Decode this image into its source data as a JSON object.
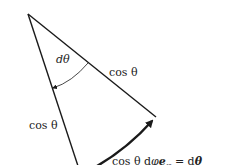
{
  "diagram": {
    "type": "geometric-wedge",
    "labels": {
      "angle": "dθ",
      "right_edge": "cos θ",
      "left_edge": "cos θ",
      "bottom_eq_prefix": "cos θ d",
      "bottom_eq_phi": "φ",
      "bottom_eq_vec": "e",
      "bottom_eq_sub": "φ",
      "bottom_eq_equals": " = d",
      "bottom_eq_rhs": "θ"
    },
    "colors": {
      "line": "#1a1a1a",
      "text": "#222222",
      "background": "#ffffff"
    }
  }
}
